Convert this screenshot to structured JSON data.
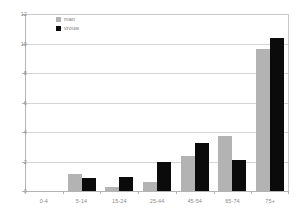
{
  "chart_data": {
    "type": "bar",
    "title": "",
    "subtitle": "",
    "xlabel": "",
    "ylabel": "",
    "ylim": [
      0,
      12
    ],
    "yticks": [
      0,
      2,
      4,
      6,
      8,
      10,
      12
    ],
    "ytick_labels": [
      "0",
      "2",
      "4",
      "6",
      "8",
      "10",
      "12"
    ],
    "grid": "horizontal",
    "legend_position": "top-left-inside",
    "categories": [
      "0-4",
      "5-14",
      "15-24",
      "25-44",
      "45-54",
      "65-74",
      "75+"
    ],
    "series": [
      {
        "name": "man",
        "color": "#b3b3b3",
        "values": [
          0,
          1.15,
          0.3,
          0.6,
          2.4,
          3.7,
          9.6
        ]
      },
      {
        "name": "vrouw",
        "color": "#0b0b0b",
        "values": [
          0,
          0.9,
          0.95,
          2.0,
          3.25,
          2.1,
          10.35
        ]
      }
    ]
  },
  "legend": {
    "items": [
      {
        "label": "man"
      },
      {
        "label": "vrouw"
      }
    ]
  }
}
